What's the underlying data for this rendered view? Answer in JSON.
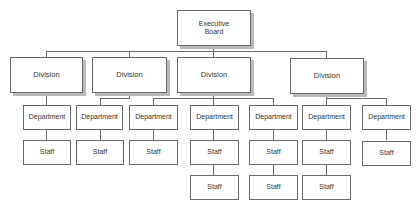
{
  "chart_title": "",
  "root": {
    "label": "Executive Board",
    "line1": "Executive",
    "line2": "Board"
  },
  "divisions": [
    {
      "label": "Division"
    },
    {
      "label": "Division"
    },
    {
      "label": "Division"
    },
    {
      "label": "Division"
    }
  ],
  "departments": [
    {
      "label": "Department",
      "division": 0,
      "staff": [
        "Staff"
      ]
    },
    {
      "label": "Department",
      "division": 1,
      "staff": [
        "Staff"
      ]
    },
    {
      "label": "Department",
      "division": 1,
      "staff": [
        "Staff"
      ]
    },
    {
      "label": "Department",
      "division": 2,
      "staff": [
        "Staff",
        "Staff"
      ]
    },
    {
      "label": "Department",
      "division": 2,
      "staff": [
        "Staff",
        "Staff"
      ]
    },
    {
      "label": "Department",
      "division": 3,
      "staff": [
        "Staff",
        "Staff"
      ]
    },
    {
      "label": "Department",
      "division": 3,
      "staff": [
        "Staff"
      ]
    }
  ],
  "colors": {
    "border": "#6a6a6a",
    "shadow": "#b9b9b9",
    "text": "#333333",
    "background": "#ffffff"
  }
}
